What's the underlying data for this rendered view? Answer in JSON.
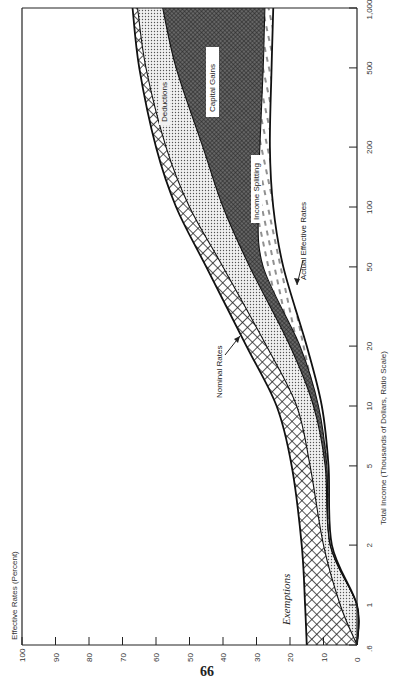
{
  "page": {
    "number": "66"
  },
  "chart_data": {
    "type": "area",
    "orientation": "rotated 90° counter-clockwise (income axis vertical on right, rate axis horizontal at bottom)",
    "title": "",
    "xlabel": "Total Income (Thousands of Dollars, Ratio Scale)",
    "ylabel": "Effective Rates (Percent)",
    "x_scale": "log",
    "x_ticks": [
      "0.6",
      "1",
      "2",
      "5",
      "10",
      "20",
      "50",
      "100",
      "200",
      "500",
      "1,000"
    ],
    "y_ticks": [
      "0",
      "10",
      "20",
      "30",
      "40",
      "50",
      "60",
      "70",
      "80",
      "90",
      "100"
    ],
    "ylim": [
      0,
      100
    ],
    "xlim": [
      0.6,
      1000
    ],
    "grid": false,
    "x": [
      0.6,
      1,
      2,
      5,
      10,
      20,
      50,
      100,
      200,
      500,
      1000
    ],
    "series": [
      {
        "name": "Nominal Rates",
        "values": [
          15,
          15.5,
          16.5,
          19.5,
          24,
          33,
          45,
          54,
          60,
          65,
          67
        ]
      },
      {
        "name": "After Exemptions",
        "values": [
          0,
          5,
          10,
          14,
          18,
          27,
          40,
          50,
          57,
          63,
          65.5
        ]
      },
      {
        "name": "After Deductions",
        "values": [
          0,
          0,
          8,
          9.5,
          13,
          20,
          32,
          40,
          46,
          54,
          58
        ]
      },
      {
        "name": "After Capital Gains",
        "values": [
          0,
          0,
          8,
          9,
          11.5,
          17,
          28,
          29.5,
          29,
          28,
          27.5
        ]
      },
      {
        "name": "Actual Effective Rates",
        "values": [
          0,
          0,
          7.5,
          8.5,
          10.5,
          15,
          22,
          25,
          26,
          25.5,
          25
        ]
      }
    ],
    "bands": [
      {
        "name": "Exemptions",
        "between": [
          "Nominal Rates",
          "After Exemptions"
        ],
        "pattern": "crosshatch"
      },
      {
        "name": "Deductions",
        "between": [
          "After Exemptions",
          "After Deductions"
        ],
        "pattern": "dots"
      },
      {
        "name": "Capital Gains",
        "between": [
          "After Deductions",
          "After Capital Gains"
        ],
        "pattern": "dense crosshatch"
      },
      {
        "name": "Income Splitting",
        "between": [
          "After Capital Gains",
          "Actual Effective Rates"
        ],
        "pattern": "dashes"
      }
    ],
    "annotations": [
      {
        "text": "Nominal Rates",
        "arrow_to": "Nominal Rates curve near 20K"
      },
      {
        "text": "Actual Effective Rates",
        "arrow_to": "Actual curve near 40K"
      },
      {
        "text": "Exemptions"
      },
      {
        "text": "Deductions"
      },
      {
        "text": "Capital Gains"
      },
      {
        "text": "Income Splitting"
      }
    ]
  },
  "labels": {
    "y_axis_title": "Effective Rates (Percent)",
    "x_axis_title": "Total Income (Thousands of Dollars, Ratio Scale)",
    "nominal": "Nominal Rates",
    "actual": "Actual Effective Rates",
    "exemptions": "Exemptions",
    "deductions": "Deductions",
    "capital_gains": "Capital Gains",
    "income_splitting": "Income Splitting"
  }
}
